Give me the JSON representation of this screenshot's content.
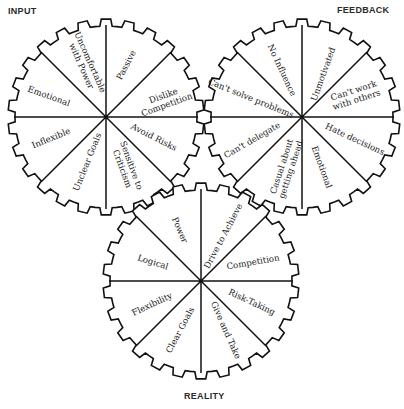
{
  "titles": {
    "input": "INPUT",
    "feedback": "FEEDBACK",
    "reality": "REALITY"
  },
  "gears": [
    {
      "id": "input",
      "cx": 106,
      "cy": 117,
      "r": 98,
      "segments": [
        {
          "label": "Passive",
          "lines": [
            "Passive"
          ],
          "x": 126,
          "y": 65,
          "rot": -62
        },
        {
          "label": "Dislike Competition",
          "lines": [
            "Dislike",
            "Competition"
          ],
          "x": 165,
          "y": 100,
          "rot": -20
        },
        {
          "label": "Avoid Risks",
          "lines": [
            "Avoid Risks"
          ],
          "x": 154,
          "y": 137,
          "rot": 27
        },
        {
          "label": "Sensitive to Criticism",
          "lines": [
            "Sensitive to",
            "Criticism"
          ],
          "x": 127,
          "y": 167,
          "rot": 70
        },
        {
          "label": "Unclear Goals",
          "lines": [
            "Unclear Goals"
          ],
          "x": 87,
          "y": 162,
          "rot": -68
        },
        {
          "label": "Inflexible",
          "lines": [
            "Inflexible"
          ],
          "x": 51,
          "y": 138,
          "rot": -22
        },
        {
          "label": "Emotional",
          "lines": [
            "Emotional"
          ],
          "x": 49,
          "y": 96,
          "rot": 20
        },
        {
          "label": "Uncomfortable with Power",
          "lines": [
            "Uncomfortable",
            "with Power"
          ],
          "x": 86,
          "y": 64,
          "rot": 66
        }
      ]
    },
    {
      "id": "feedback",
      "cx": 302,
      "cy": 117,
      "r": 98,
      "segments": [
        {
          "label": "Unmotivated",
          "lines": [
            "Unmotivated"
          ],
          "x": 323,
          "y": 74,
          "rot": -70
        },
        {
          "label": "Can't work with others",
          "lines": [
            "Can't work",
            "with others"
          ],
          "x": 355,
          "y": 95,
          "rot": -18
        },
        {
          "label": "Hate decisions",
          "lines": [
            "Hate decisions"
          ],
          "x": 355,
          "y": 139,
          "rot": 25
        },
        {
          "label": "Emotional",
          "lines": [
            "Emotional"
          ],
          "x": 322,
          "y": 167,
          "rot": 70
        },
        {
          "label": "Casual about getting ahead",
          "lines": [
            "Casual about",
            "getting ahead"
          ],
          "x": 286,
          "y": 168,
          "rot": -72
        },
        {
          "label": "Can't delegate",
          "lines": [
            "Can't delegate"
          ],
          "x": 252,
          "y": 140,
          "rot": -30
        },
        {
          "label": "Can't solve problems",
          "lines": [
            "Can't solve problems"
          ],
          "x": 251,
          "y": 98,
          "rot": 22
        },
        {
          "label": "No Influence",
          "lines": [
            "No Influence"
          ],
          "x": 282,
          "y": 70,
          "rot": 65
        }
      ]
    },
    {
      "id": "reality",
      "cx": 201,
      "cy": 281,
      "r": 98,
      "segments": [
        {
          "label": "Drive to Achieve",
          "lines": [
            "Drive to Achieve"
          ],
          "x": 223,
          "y": 236,
          "rot": -62
        },
        {
          "label": "Competition",
          "lines": [
            "Competition"
          ],
          "x": 253,
          "y": 262,
          "rot": -10
        },
        {
          "label": "Risk-Taking",
          "lines": [
            "Risk-Taking"
          ],
          "x": 252,
          "y": 302,
          "rot": 25
        },
        {
          "label": "Give and Take",
          "lines": [
            "Give and Take"
          ],
          "x": 226,
          "y": 330,
          "rot": 66
        },
        {
          "label": "Clear Goals",
          "lines": [
            "Clear Goals"
          ],
          "x": 180,
          "y": 330,
          "rot": -62
        },
        {
          "label": "Flexibility",
          "lines": [
            "Flexibility"
          ],
          "x": 152,
          "y": 304,
          "rot": -25
        },
        {
          "label": "Logical",
          "lines": [
            "Logical"
          ],
          "x": 153,
          "y": 262,
          "rot": 18
        },
        {
          "label": "Power",
          "lines": [
            "Power"
          ],
          "x": 180,
          "y": 230,
          "rot": 66
        }
      ]
    }
  ]
}
